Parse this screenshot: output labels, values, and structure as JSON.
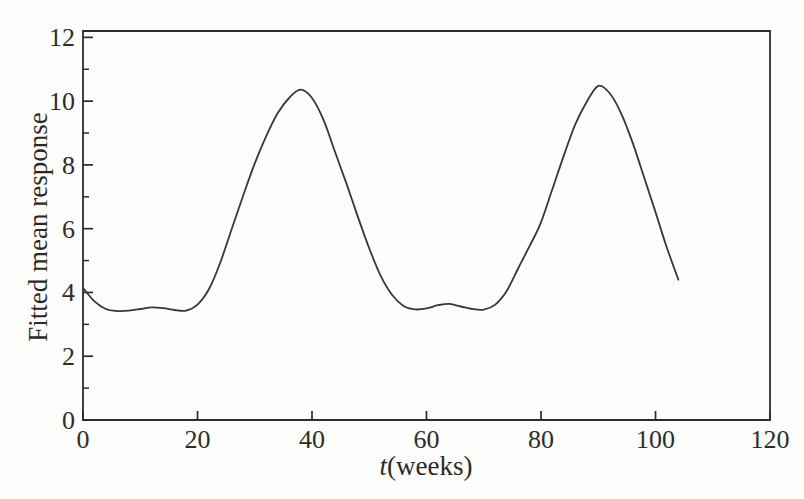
{
  "chart_data": {
    "type": "line",
    "title": "",
    "xlabel_var": "t",
    "xlabel_rest": "(weeks)",
    "ylabel": "Fitted mean response",
    "xlim": [
      0,
      120
    ],
    "ylim": [
      0,
      12.2
    ],
    "x_major_ticks": [
      0,
      20,
      40,
      60,
      80,
      100,
      120
    ],
    "y_major_ticks": [
      0,
      2,
      4,
      6,
      8,
      10,
      12
    ],
    "y_minor_ticks": [
      1,
      3,
      5,
      7,
      9,
      11
    ],
    "grid": false,
    "legend": null,
    "box": true,
    "line_color": "#3a3835",
    "axis_color": "#2e2c29",
    "background": "#fdfdfb",
    "series": [
      {
        "name": "fitted mean response curve",
        "x": [
          0,
          2,
          4,
          6,
          8,
          10,
          12,
          14,
          16,
          18,
          20,
          22,
          24,
          26,
          28,
          30,
          32,
          34,
          36,
          38,
          40,
          42,
          44,
          46,
          48,
          50,
          52,
          54,
          56,
          58,
          60,
          62,
          64,
          66,
          68,
          70,
          72,
          74,
          76,
          78,
          80,
          82,
          84,
          86,
          88,
          90,
          92,
          94,
          96,
          98,
          100,
          102,
          104
        ],
        "y": [
          4.15,
          3.72,
          3.48,
          3.42,
          3.43,
          3.48,
          3.53,
          3.51,
          3.45,
          3.43,
          3.62,
          4.1,
          4.95,
          6.0,
          7.05,
          8.05,
          8.9,
          9.62,
          10.1,
          10.36,
          10.1,
          9.42,
          8.42,
          7.42,
          6.38,
          5.38,
          4.52,
          3.92,
          3.58,
          3.47,
          3.5,
          3.6,
          3.64,
          3.56,
          3.48,
          3.46,
          3.62,
          4.05,
          4.75,
          5.45,
          6.2,
          7.25,
          8.3,
          9.28,
          9.98,
          10.48,
          10.25,
          9.62,
          8.7,
          7.62,
          6.52,
          5.4,
          4.4
        ]
      }
    ]
  }
}
